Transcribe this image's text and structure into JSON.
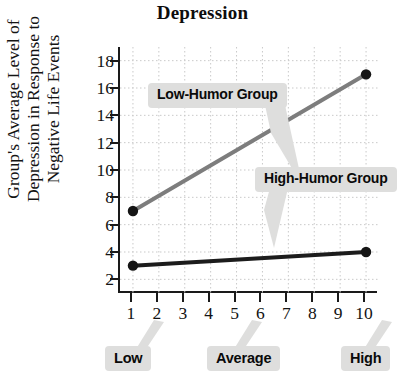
{
  "chart_data": {
    "type": "line",
    "title": "Depression",
    "xlabel": "",
    "ylabel": "Group's Average Level of Depression in Response to Negative Life Events",
    "ylabel_lines": [
      "Group's Average Level of",
      "Depression in Response to",
      "Negative Life Events"
    ],
    "x": [
      1,
      10
    ],
    "xlim": [
      0.5,
      10.5
    ],
    "ylim": [
      1,
      19
    ],
    "x_ticks": [
      1,
      2,
      3,
      4,
      5,
      6,
      7,
      8,
      9,
      10
    ],
    "x_tick_labels": [
      "1",
      "2",
      "3",
      "4",
      "5",
      "6",
      "7",
      "8",
      "9",
      "10"
    ],
    "y_ticks": [
      2,
      4,
      6,
      8,
      10,
      12,
      14,
      16,
      18
    ],
    "y_tick_labels": [
      "2",
      "4",
      "6",
      "8",
      "10",
      "12",
      "14",
      "16",
      "18"
    ],
    "grid": true,
    "grid_style": "dotted",
    "legend": "inline-callouts",
    "series": [
      {
        "name": "Low-Humor Group",
        "color": "#7d7d7d",
        "values": [
          7,
          17
        ],
        "marker": "circle",
        "marker_color": "#151515"
      },
      {
        "name": "High-Humor Group",
        "color": "#1c1c1c",
        "values": [
          3,
          4
        ],
        "marker": "circle",
        "marker_color": "#151515"
      }
    ],
    "annotations": [
      {
        "text": "Low-Humor Group",
        "target_series": "Low-Humor Group"
      },
      {
        "text": "High-Humor Group",
        "target_series": "High-Humor Group"
      }
    ],
    "x_axis_group_labels": [
      {
        "text": "Low",
        "at_x": 1
      },
      {
        "text": "Average",
        "at_x": 5
      },
      {
        "text": "High",
        "at_x": 10
      }
    ],
    "colors": {
      "low_humor_line": "#7d7d7d",
      "high_humor_line": "#1c1c1c",
      "callout_background": "#dededd",
      "axis": "#1a1a1a",
      "grid": "#c9c9c9",
      "text": "#111111"
    }
  }
}
